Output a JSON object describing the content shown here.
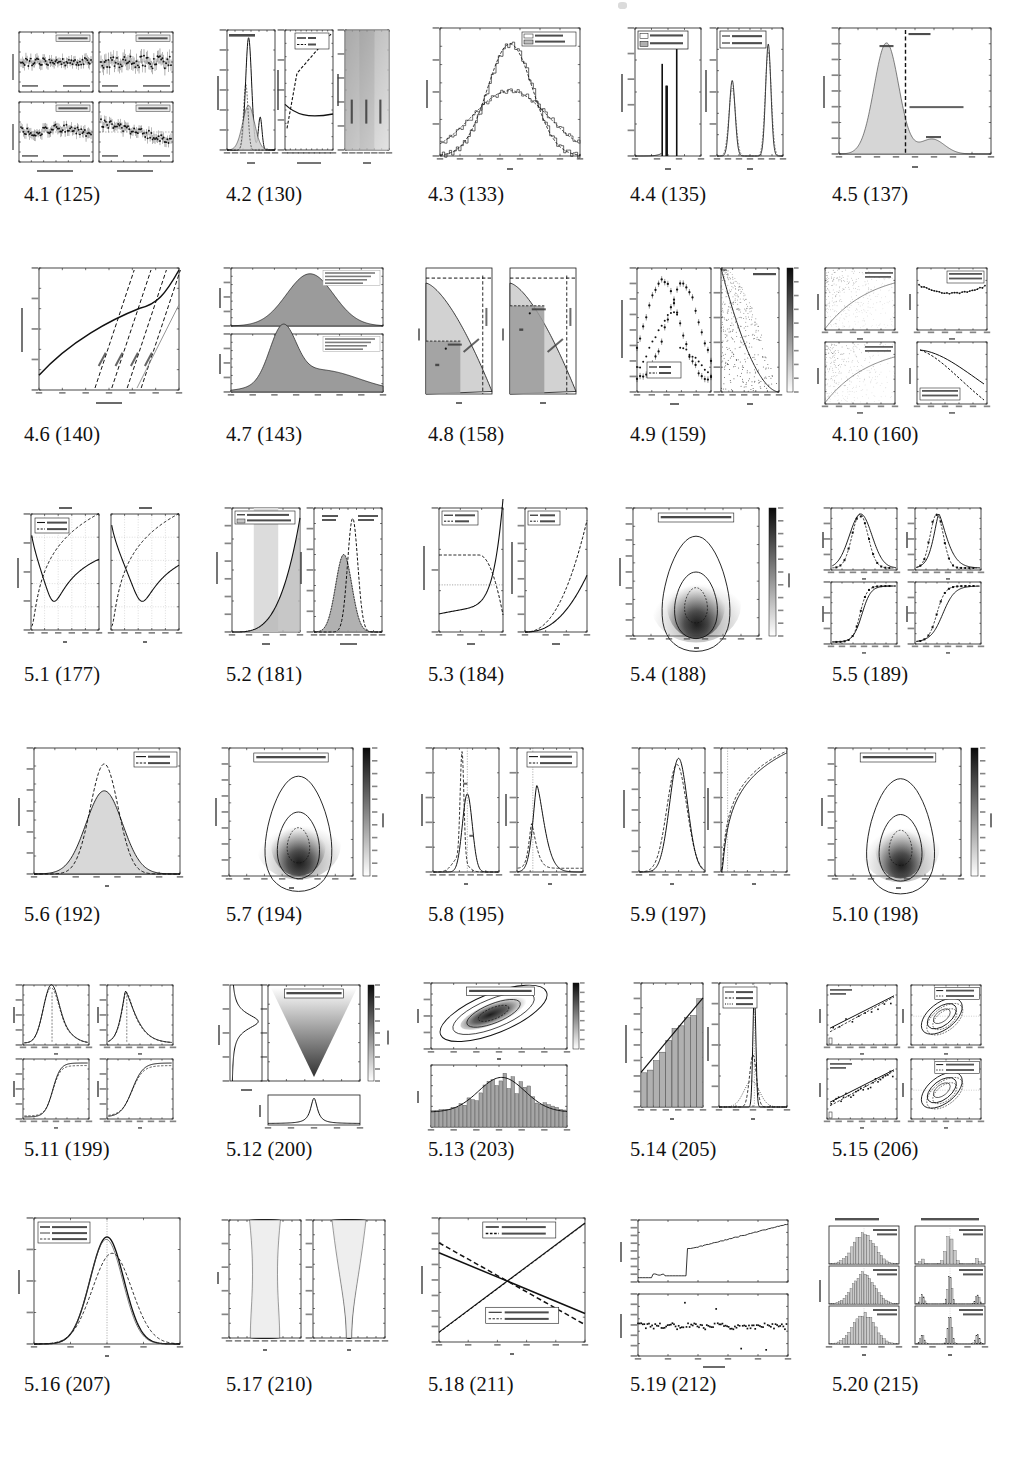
{
  "document": {
    "kind": "list-of-figures",
    "page_mark": "",
    "columns": 5,
    "rows": 6
  },
  "figures": [
    {
      "id": "4.1",
      "label": "4.1 (125)",
      "number": "4.1",
      "page": "125",
      "thumb": "fig-4-1",
      "text": [
        "Gaussian errors",
        "non-Gaussian errors",
        "underestimated errors",
        "incorrect model",
        "observations",
        "residuals"
      ]
    },
    {
      "id": "4.2",
      "label": "4.2 (130)",
      "number": "4.2",
      "page": "130",
      "thumb": "fig-4-2",
      "text": [
        "Best-fit Mixture",
        "AIC",
        "BIC",
        "p(x|m)",
        "information criterion",
        "x",
        "N components",
        "N clusters = 1",
        "N clusters = 2",
        "N clusters = 3",
        "-6 -4 -2 0 2 4 6",
        "1 2 3 4 5 6 7 8 9 10",
        "0.00",
        "0.05",
        "0.10",
        "0.15",
        "0.20",
        "0.25",
        "0.30",
        "0.0",
        "0.2",
        "0.4",
        "0.6",
        "0.8",
        "1.0"
      ]
    },
    {
      "id": "4.3",
      "label": "4.3 (133)",
      "number": "4.3",
      "page": "133",
      "thumb": "fig-4-3",
      "text": [
        "x (std. dev.)",
        "σG (quartile)",
        "p(σ|x,I)",
        "σ",
        "0.85",
        "0.90",
        "0.95",
        "1.00",
        "1.05",
        "1.10",
        "1.15",
        "0",
        "5",
        "10",
        "15",
        "20"
      ]
    },
    {
      "id": "4.4",
      "label": "4.4 (135)",
      "number": "4.4",
      "page": "135",
      "thumb": "fig-4-4",
      "text": [
        "σ* (std. dev.)",
        "σ*G (quartile)",
        "σ (std. dev.)",
        "σG (quartile)",
        "N(σ*)",
        "p(σ|x,I)",
        "σ*",
        "σ",
        "1.000",
        "1.002",
        "1.004",
        "1.006",
        "0.5 0.6 0.7 0.8 0.9 1.0 1.1"
      ]
    },
    {
      "id": "4.5",
      "label": "4.5 (137)",
      "number": "4.5",
      "page": "137",
      "thumb": "fig-4-5",
      "text": [
        "h_B(x)",
        "h_S(x)",
        "x_c = 120",
        "(x > x_c classified as source)",
        "p(x)",
        "x",
        "0.000",
        "0.005",
        "0.010",
        "0.015",
        "0.020",
        "0.025",
        "0.030",
        "0.035",
        "0.040",
        "60",
        "80",
        "100",
        "120",
        "140",
        "160",
        "180",
        "200"
      ]
    },
    {
      "id": "4.6",
      "label": "4.6 (140)",
      "number": "4.6",
      "page": "140",
      "thumb": "fig-4-6",
      "text": [
        "normalized C(δ)",
        "x = 1 − H₀(x)",
        "10⁻¹²",
        "10⁻¹⁰",
        "10⁻⁸",
        "10⁻⁶",
        "10⁻⁴",
        "10⁻²",
        "10⁰"
      ]
    },
    {
      "id": "4.7",
      "label": "4.7 (143)",
      "number": "4.7",
      "page": "143",
      "thumb": "fig-4-7",
      "text": [
        "Anderson-Darling",
        "Kolmogorov-Smirnov",
        "Shapiro-Wilk",
        "p(x)"
      ]
    },
    {
      "id": "4.8",
      "label": "4.8 (158)",
      "number": "4.8",
      "page": "158",
      "thumb": "fig-4-8",
      "text": [
        "p(x₀,y₀)",
        "A",
        "B",
        "y",
        "x"
      ]
    },
    {
      "id": "4.9",
      "label": "4.9 (159)",
      "number": "4.9",
      "page": "159",
      "thumb": "fig-4-9",
      "text": [
        "normalized distribution",
        "p(x)",
        "p(y)",
        "500 points",
        "x, y",
        "x",
        "y",
        "0.0",
        "0.2",
        "0.4",
        "0.6",
        "0.8",
        "1.0"
      ]
    },
    {
      "id": "4.10",
      "label": "4.10 (160)",
      "number": "4.10",
      "page": "160",
      "thumb": "fig-4-10",
      "text": [
        "a = -1.00",
        "b = 0.0500",
        "a = -1.00",
        "b = 0.0000",
        "x",
        "y"
      ]
    },
    {
      "id": "5.1",
      "label": "5.1 (177)",
      "number": "5.1",
      "page": "177",
      "thumb": "fig-5-1",
      "text": [
        "n = 10",
        "n = 20",
        "b⁰ = 0.1",
        "b⁰ = 0.5",
        "C(b)",
        "b",
        "0",
        "2",
        "4",
        "6",
        "8",
        "10",
        "12",
        "14",
        "16",
        "18",
        "20"
      ]
    },
    {
      "id": "5.2",
      "label": "5.2 (181)",
      "number": "5.2",
      "page": "181",
      "thumb": "fig-5-2",
      "text": [
        "true distribution",
        "observed distribution",
        "observed sample",
        "random sample",
        "p(x_obs)",
        "x_obs",
        "x_obs − x_true",
        "3",
        "4",
        "5",
        "6",
        "7",
        "-4 -3 -2 -1 0 1 2 3 4"
      ]
    },
    {
      "id": "5.3",
      "label": "5.3 (184)",
      "number": "5.3",
      "page": "184",
      "thumb": "fig-5-3",
      "text": [
        "scatter",
        "bias",
        "μ = 2",
        "μ = 4",
        "bias/scatter (mag)",
        "absolute magnitude bias",
        "m_lim",
        "σ/m",
        "21",
        "22",
        "23",
        "24",
        "0.0",
        "0.1",
        "0.2",
        "0.3"
      ]
    },
    {
      "id": "5.4",
      "label": "5.4 (188)",
      "number": "5.4",
      "page": "188",
      "thumb": "fig-5-4",
      "text": [
        "L(μ,σ) for x̄ = 1, V = 4, n = 10",
        "log(L)",
        "μ",
        "σ",
        "0.0",
        "-0.5",
        "-1.0",
        "-1.5",
        "-2.0",
        "-2.5",
        "-3.0",
        "-3.5",
        "-4.0",
        "-4.5",
        "-5.0"
      ]
    },
    {
      "id": "5.5",
      "label": "5.5 (189)",
      "number": "5.5",
      "page": "189",
      "thumb": "fig-5-5",
      "text": [
        "p(x|μ,σ)",
        "P(<x|μ,σ)",
        "x"
      ]
    },
    {
      "id": "5.6",
      "label": "5.6 (192)",
      "number": "5.6",
      "page": "192",
      "thumb": "fig-5-6",
      "text": [
        "σ fit",
        "σ_G fit",
        "p(x)",
        "x",
        "0.00",
        "0.05",
        "0.10",
        "0.15",
        "0.20",
        "0.25",
        "0.30"
      ]
    },
    {
      "id": "5.7",
      "label": "5.7 (194)",
      "number": "5.7",
      "page": "194",
      "thumb": "fig-5-7",
      "text": [
        "L(μ,γ) for x̄ = 1, σ_true = 1, n = 10",
        "log(L)",
        "μ",
        "γ",
        "0.0",
        "-0.5",
        "-1.0",
        "-1.5",
        "-2.0",
        "-2.5",
        "-3.0",
        "-3.5",
        "-4.0",
        "-4.5",
        "-5.0"
      ]
    },
    {
      "id": "5.8",
      "label": "5.8 (195)",
      "number": "5.8",
      "page": "195",
      "thumb": "fig-5-8",
      "text": [
        "marginalized",
        "approximate",
        "p(μ|x,I)",
        "p(γ|x,I)",
        "μ",
        "γ",
        "0.0",
        "0.2",
        "0.4",
        "0.6",
        "0.8",
        "1.0"
      ]
    },
    {
      "id": "5.9",
      "label": "5.9 (197)",
      "number": "5.9",
      "page": "197",
      "thumb": "fig-5-9",
      "text": [
        "p(b|k,N)",
        "P(<b|k,N)",
        "b",
        "0.0",
        "0.2",
        "0.4",
        "0.6",
        "0.8",
        "1.0"
      ]
    },
    {
      "id": "5.10",
      "label": "5.10 (198)",
      "number": "5.10",
      "page": "198",
      "thumb": "fig-5-10",
      "text": [
        "L(μ,γ) for x̄ = 0, γ = 2, n = 10",
        "log(L)",
        "μ",
        "γ",
        "0.0",
        "-0.5",
        "-1.0",
        "-1.5",
        "-2.0",
        "-2.5",
        "-3.0",
        "-3.5",
        "-4.0",
        "-4.5",
        "-5.0"
      ]
    },
    {
      "id": "5.11",
      "label": "5.11 (199)",
      "number": "5.11",
      "page": "199",
      "thumb": "fig-5-11",
      "text": [
        "p(μ|x,I)",
        "p(σ|x,I)",
        "P(<μ|x,I)",
        "P(<σ|x,I)",
        "μ",
        "σ"
      ]
    },
    {
      "id": "5.12",
      "label": "5.12 (200)",
      "number": "5.12",
      "page": "200",
      "thumb": "fig-5-12",
      "text": [
        "L(μ, W) uniform, n = 100",
        "log L(μ, W)",
        "p(W)",
        "p(μ)",
        "W",
        "μ",
        "4.0",
        "4.4",
        "5.0",
        "5.2",
        "5.4"
      ]
    },
    {
      "id": "5.13",
      "label": "5.13 (203)",
      "number": "5.13",
      "page": "203",
      "thumb": "fig-5-13",
      "text": [
        "L(μ, σ) for Gaussian + background, n = 100",
        "log L",
        "μ",
        "σ",
        "x"
      ]
    },
    {
      "id": "5.14",
      "label": "5.14 (205)",
      "number": "5.14",
      "page": "205",
      "thumb": "fig-5-14",
      "text": [
        "500 pts",
        "100 pts",
        "20 pts",
        "p(x|a,b)",
        "p(a|x,I)",
        "x",
        "a",
        "0",
        "2",
        "4",
        "6",
        "8",
        "10",
        "-0.02",
        "0.00",
        "0.01",
        "0.02"
      ]
    },
    {
      "id": "5.15",
      "label": "5.15 (206)",
      "number": "5.15",
      "page": "206",
      "thumb": "fig-5-15",
      "text": [
        "Poisson Likelihood",
        "Gaussian Likelihood",
        "50 points",
        "5 bins",
        "50 points",
        "40 bins",
        "a",
        "b",
        "x",
        "a*"
      ]
    },
    {
      "id": "5.16",
      "label": "5.16 (207)",
      "number": "5.16",
      "page": "207",
      "thumb": "fig-5-16",
      "text": [
        "continuous",
        "discrete, 1000 bins",
        "discrete, 2 bins",
        "p(a)",
        "a",
        "0.000",
        "0.005",
        "0.010",
        "0.015",
        "0.020"
      ]
    },
    {
      "id": "5.17",
      "label": "5.17 (210)",
      "number": "5.17",
      "page": "210",
      "thumb": "fig-5-17",
      "text": [
        "σ",
        "μ",
        "0.0",
        "0.2",
        "0.4",
        "0.6",
        "0.8",
        "1.0",
        "-4",
        "-2",
        "0",
        "2",
        "4"
      ]
    },
    {
      "id": "5.18",
      "label": "5.18 (211)",
      "number": "5.18",
      "page": "211",
      "thumb": "fig-5-18",
      "text": [
        "p(g₁) (fast points)",
        "p(b|μ,σ) (fast points)",
        "p(g₁) (good points)",
        "p(b|μ,σ) (good points)",
        "P(x|g₁)",
        "g₁",
        "0.0",
        "0.2",
        "0.4",
        "0.6",
        "0.8",
        "1.0"
      ]
    },
    {
      "id": "5.19",
      "label": "5.19 (212)",
      "number": "5.19",
      "page": "212",
      "thumb": "fig-5-19",
      "text": [
        "O₂₁ = Bayes ratio of posteriors",
        "Sample Value",
        "Sample Size N",
        "0",
        "20",
        "40",
        "60",
        "80",
        "100"
      ]
    },
    {
      "id": "5.20",
      "label": "5.20 (215)",
      "number": "5.20",
      "page": "215",
      "thumb": "fig-5-20",
      "text": [
        "Gaussian distribution",
        "non-Gaussian distribution",
        "Scott's Rule",
        "38 bins",
        "Freed.-Diac.",
        "49 bins",
        "Knuth's Rule",
        "38 bins",
        "Scott's Rule",
        "38 bins",
        "Freed.-Diac.",
        "97 bins",
        "Knuth's Rule",
        "99 bins",
        "p(x|x)",
        "x",
        "-4",
        "-2",
        "0",
        "2",
        "4"
      ]
    }
  ],
  "colors": {
    "ink": "#111111",
    "plot_line": "#1a1a1a",
    "fill_light": "#d4d4d4",
    "fill_mid": "#9a9a9a",
    "fill_dark": "#555555",
    "axis": "#222222",
    "page_bg": "#ffffff"
  }
}
